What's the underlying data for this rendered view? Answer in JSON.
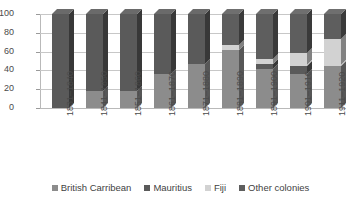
{
  "chart_data": {
    "type": "bar",
    "subtype": "stacked-column-100pct-3d",
    "title": "",
    "subtitle": "",
    "xlabel": "",
    "ylabel": "",
    "ylim": [
      0,
      100
    ],
    "yticks": [
      0,
      20,
      40,
      60,
      80,
      100
    ],
    "ytick_labels": [
      "0",
      "20",
      "40",
      "60",
      "80",
      "100"
    ],
    "grid": true,
    "legend_position": "bottom",
    "categories": [
      "1831–1840",
      "1841–1850",
      "1851–1860",
      "1861–1870",
      "1871–1880",
      "1881–1890",
      "1891–1900",
      "1901–1910",
      "1911–1920"
    ],
    "series": [
      {
        "name": "British Carribean",
        "color": "#8c8c8c",
        "values": [
          0,
          18,
          18,
          36,
          47,
          62,
          42,
          36,
          45
        ]
      },
      {
        "name": "Mauritius",
        "color": "#5a5a5a",
        "values": [
          100,
          82,
          82,
          64,
          53,
          0,
          5,
          9,
          0
        ]
      },
      {
        "name": "Fiji",
        "color": "#d2d2d2",
        "values": [
          0,
          0,
          0,
          0,
          0,
          5,
          5,
          13,
          28
        ]
      },
      {
        "name": "Other colonies",
        "color": "#5e5e5e",
        "values": [
          0,
          0,
          0,
          0,
          0,
          33,
          48,
          42,
          27
        ]
      }
    ]
  },
  "legend": {
    "items": [
      {
        "label": "British Carribean",
        "color": "#8c8c8c"
      },
      {
        "label": "Mauritius",
        "color": "#5a5a5a"
      },
      {
        "label": "Fiji",
        "color": "#d2d2d2"
      },
      {
        "label": "Other colonies",
        "color": "#5e5e5e"
      }
    ]
  },
  "colors": {
    "background": "#ffffff",
    "gridline": "#c7c7c7",
    "axis": "#b9b9b9",
    "text": "#3f3f3f"
  }
}
